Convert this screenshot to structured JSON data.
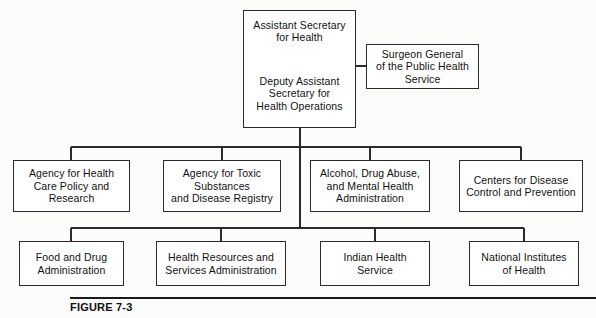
{
  "figure": {
    "caption": "FIGURE 7-3"
  },
  "nodes": {
    "assistant_secretary": {
      "title_line1": "Assistant Secretary",
      "title_line2": "for Health",
      "sub_line1": "Deputy Assistant",
      "sub_line2": "Secretary for",
      "sub_line3": "Health Operations"
    },
    "surgeon_general": {
      "line1": "Surgeon General",
      "line2": "of the Public Health",
      "line3": "Service"
    },
    "ahcpr": {
      "line1": "Agency for Health",
      "line2": "Care Policy and",
      "line3": "Research"
    },
    "atsdr": {
      "line1": "Agency for Toxic",
      "line2": "Substances",
      "line3": "and Disease Registry"
    },
    "adamha": {
      "line1": "Alcohol, Drug Abuse,",
      "line2": "and Mental Health",
      "line3": "Administration"
    },
    "cdc": {
      "line1": "Centers for Disease",
      "line2": "Control and Prevention"
    },
    "fda": {
      "line1": "Food and Drug",
      "line2": "Administration"
    },
    "hrsa": {
      "line1": "Health Resources and",
      "line2": "Services Administration"
    },
    "ihs": {
      "line1": "Indian Health",
      "line2": "Service"
    },
    "nih": {
      "line1": "National Institutes",
      "line2": "of Health"
    }
  },
  "style": {
    "line_color": "#2b2b2b",
    "box_fill": "#ffffff",
    "page_background": "#fbfbf9",
    "text_color": "#111111"
  }
}
